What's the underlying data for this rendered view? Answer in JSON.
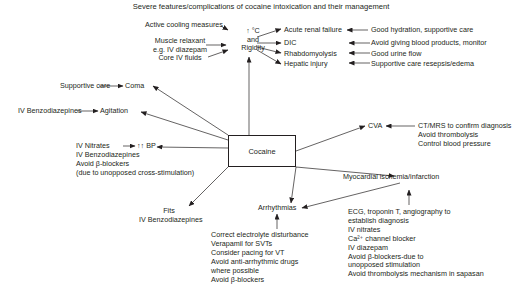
{
  "title": "Severe features/complications of cocaine intoxication and their management",
  "center": "Cocaine",
  "hyperthermia": {
    "node": [
      "°C",
      "and",
      "Rigidity"
    ],
    "treatments": [
      "Active cooling measures",
      "Muscle relaxant",
      "e.g. IV diazepam",
      "Core IV fluids"
    ],
    "complications": [
      {
        "label": "Acute renal failure",
        "management": "Good hydration, supportive care"
      },
      {
        "label": "DIC",
        "management": "Avoid giving blood products, monitor"
      },
      {
        "label": "Rhabdomyolysis",
        "management": "Good urine flow"
      },
      {
        "label": "Hepatic injury",
        "management": "Supportive care resepsis/edema"
      }
    ]
  },
  "coma": {
    "label": "Coma",
    "management": "Supportive care"
  },
  "agitation": {
    "label": "Agitation",
    "management": "IV Benzodiazepines"
  },
  "bp": {
    "label": "BP",
    "arrows": "↑↑",
    "management": [
      "IV Nitrates",
      "IV Benzodiazepines",
      "Avoid β-blockers",
      "(due to unopposed cross-stimulation)"
    ]
  },
  "fits": {
    "label": "Fits",
    "management": "IV Benzodiazepines"
  },
  "cva": {
    "label": "CVA",
    "management": [
      "CT/MRS to confirm diagnosis",
      "Avoid thrombolysis",
      "Control blood pressure"
    ]
  },
  "arrhythmias": {
    "label": "Arrhythmias",
    "management": [
      "Correct electrolyte disturbance",
      "Verapamil for SVTs",
      "Consider pacing for VT",
      "Avoid anti-arrhythmic drugs",
      "where possible",
      "Avoid β-blockers"
    ]
  },
  "mi": {
    "label": "Myocardial ischemia/infarction",
    "management": [
      "ECG, troponin T, angiography to",
      "establish diagnosis",
      "IV nitrates",
      "Ca²⁺ channel blocker",
      "IV diazepam",
      "Avoid β-blockers-due to",
      "unopposed stimulation",
      "Avoid thrombolysis mechanism in sapasan"
    ]
  },
  "colors": {
    "ink": "#231f20",
    "background": "#ffffff"
  }
}
